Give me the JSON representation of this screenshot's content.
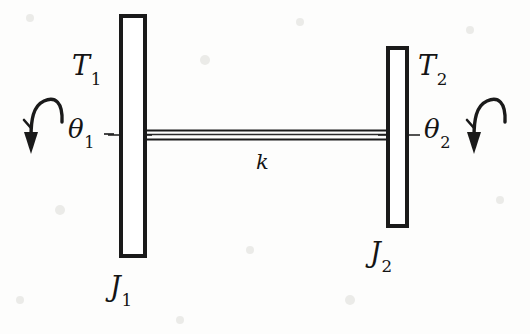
{
  "figure": {
    "background_color": "#fdfdfc",
    "ink_color": "#1a1a1a"
  },
  "labels": {
    "torque_left": {
      "symbol": "T",
      "subscript": "1"
    },
    "torque_right": {
      "symbol": "T",
      "subscript": "2"
    },
    "angle_left": {
      "symbol": "θ",
      "subscript": "1"
    },
    "angle_right": {
      "symbol": "θ",
      "subscript": "2"
    },
    "stiffness": {
      "symbol": "k",
      "subscript": ""
    },
    "inertia_left": {
      "symbol": "J",
      "subscript": "1"
    },
    "inertia_right": {
      "symbol": "J",
      "subscript": "2"
    }
  },
  "elements": {
    "disc_left_name": "inertia-disc-1",
    "disc_right_name": "inertia-disc-2",
    "shaft_name": "torsional-shaft",
    "arrow_left_name": "rotation-arrow-1",
    "arrow_right_name": "rotation-arrow-2"
  },
  "geometry": {
    "disc_left": {
      "x": 119,
      "y": 14,
      "width": 27,
      "height": 244
    },
    "disc_right": {
      "x": 386,
      "y": 46,
      "width": 22,
      "height": 182
    },
    "shaft": {
      "x1": 132,
      "x2": 397,
      "y_top": 130,
      "y_bottom": 140
    }
  }
}
